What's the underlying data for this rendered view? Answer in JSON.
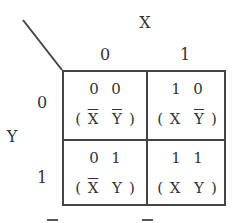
{
  "diagram": {
    "type": "karnaugh-map",
    "column_variable": "X",
    "row_variable": "Y",
    "column_headers": [
      "0",
      "1"
    ],
    "row_headers": [
      "0",
      "1"
    ],
    "cells": [
      {
        "row": 0,
        "col": 0,
        "bits": [
          "0",
          "0"
        ],
        "term": [
          {
            "var": "X",
            "negated": true
          },
          {
            "var": "Y",
            "negated": true
          }
        ]
      },
      {
        "row": 0,
        "col": 1,
        "bits": [
          "1",
          "0"
        ],
        "term": [
          {
            "var": "X",
            "negated": false
          },
          {
            "var": "Y",
            "negated": true
          }
        ]
      },
      {
        "row": 1,
        "col": 0,
        "bits": [
          "0",
          "1"
        ],
        "term": [
          {
            "var": "X",
            "negated": true
          },
          {
            "var": "Y",
            "negated": false
          }
        ]
      },
      {
        "row": 1,
        "col": 1,
        "bits": [
          "1",
          "1"
        ],
        "term": [
          {
            "var": "X",
            "negated": false
          },
          {
            "var": "Y",
            "negated": false
          }
        ]
      }
    ],
    "colors": {
      "line": "#444444",
      "text": "#333333",
      "background": "#ffffff"
    }
  },
  "labels": {
    "x": "X",
    "y": "Y",
    "col0": "0",
    "col1": "1",
    "row0": "0",
    "row1": "1",
    "open_paren": "(",
    "close_paren": ")"
  },
  "cells": {
    "c00": {
      "b1": "0",
      "b2": "0",
      "v1": "X",
      "v2": "Y"
    },
    "c01": {
      "b1": "1",
      "b2": "0",
      "v1": "X",
      "v2": "Y"
    },
    "c10": {
      "b1": "0",
      "b2": "1",
      "v1": "X",
      "v2": "Y"
    },
    "c11": {
      "b1": "1",
      "b2": "1",
      "v1": "X",
      "v2": "Y"
    }
  }
}
